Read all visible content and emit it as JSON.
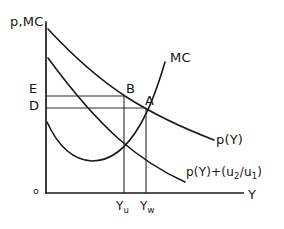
{
  "figure": {
    "kind": "economics-diagram",
    "background_color": "#ffffff",
    "ink_color": "#141414",
    "axes": {
      "y_axis_label": "p,MC",
      "x_axis_label": "Y",
      "origin_label": "o"
    },
    "price_levels": [
      {
        "id": "E",
        "label": "E"
      },
      {
        "id": "D",
        "label": "D"
      }
    ],
    "points": [
      {
        "id": "B",
        "label": "B"
      },
      {
        "id": "A",
        "label": "A"
      }
    ],
    "quantity_ticks": [
      {
        "id": "Yu",
        "base": "Y",
        "sub": "u"
      },
      {
        "id": "Yw",
        "base": "Y",
        "sub": "w"
      }
    ],
    "curves": [
      {
        "id": "mc",
        "label": "MC"
      },
      {
        "id": "demand",
        "label": "p(Y)"
      },
      {
        "id": "demand-shifted",
        "label_part1": "p(Y)+(u",
        "label_sub1": "2",
        "label_part2": "/u",
        "label_sub2": "1",
        "label_part3": ")"
      }
    ]
  }
}
